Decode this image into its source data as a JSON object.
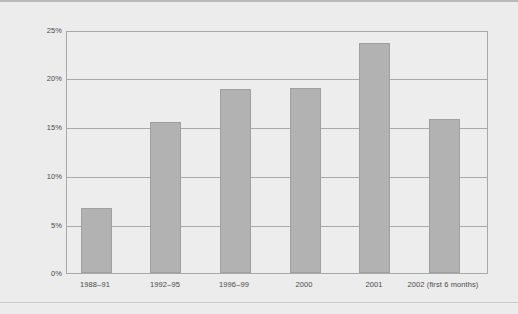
{
  "chart_data": {
    "type": "bar",
    "title": "",
    "subtitle": "",
    "xlabel": "",
    "ylabel": "",
    "categories": [
      "1988–91",
      "1992–95",
      "1996–99",
      "2000",
      "2001",
      "2002 (first 6 months)"
    ],
    "values": [
      6.7,
      15.7,
      19.1,
      19.2,
      23.9,
      16.0
    ],
    "series": [
      {
        "name": "Share",
        "values": [
          6.7,
          15.7,
          19.1,
          19.2,
          23.9,
          16.0
        ]
      }
    ],
    "ylim": [
      0,
      25
    ],
    "yticks": [
      0,
      5,
      10,
      15,
      20,
      25
    ],
    "ytick_labels": [
      "0%",
      "5%",
      "10%",
      "15%",
      "20%",
      "25%"
    ],
    "value_format": "percent",
    "grid": true,
    "grid_axis": "y",
    "legend": false,
    "legend_position": "none",
    "bar_color": "#b2b2b2",
    "bar_border_color": "#a0a0a0",
    "grid_color": "#a9a9a9",
    "axis_color": "#a8a8a8",
    "plot_background": "#ededed",
    "figure_background": "#ececec",
    "text_color": "#4a4a4a"
  }
}
